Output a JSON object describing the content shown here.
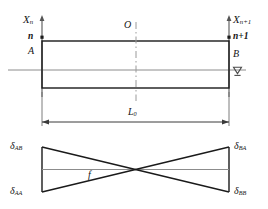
{
  "figure": {
    "type": "structural-beam-influence-diagram",
    "upper": {
      "axis_left_label": "X",
      "axis_left_sub": "n",
      "axis_right_label": "X",
      "axis_right_sub": "n+1",
      "node_left": "n",
      "node_right": "n+1",
      "end_left": "A",
      "end_right": "B",
      "origin": "O",
      "support_icon": "roller-support-icon"
    },
    "dimension": {
      "label": "L",
      "sub": "0"
    },
    "lower": {
      "curve_label": "f",
      "delta_top_left_sym": "δ",
      "delta_top_left_sub": "AB",
      "delta_bottom_left_sym": "δ",
      "delta_bottom_left_sub": "AA",
      "delta_top_right_sym": "δ",
      "delta_top_right_sub": "BA",
      "delta_bottom_right_sym": "δ",
      "delta_bottom_right_sub": "BB"
    },
    "colors": {
      "line": "#1a1a1a",
      "centerline": "#808080",
      "background": "#ffffff"
    }
  }
}
